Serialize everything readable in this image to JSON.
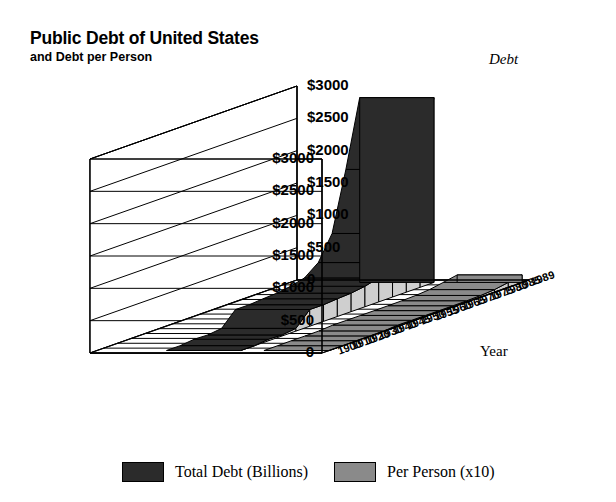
{
  "title": {
    "main": "Public Debt of United States",
    "sub": "and Debt per Person"
  },
  "axes": {
    "value_title": "Debt",
    "category_title": "Year",
    "value_ticks": [
      "$3000",
      "$2500",
      "$2000",
      "$1500",
      "$1000",
      "$500",
      "0"
    ]
  },
  "legend": {
    "items": [
      {
        "label": "Total Debt (Billions)",
        "color": "#2b2b2b"
      },
      {
        "label": "Per Person (x10)",
        "color": "#8a8a8a"
      }
    ]
  },
  "colors": {
    "series_total_top": "#2b2b2b",
    "series_total_side": "#cfcfcf",
    "series_person_top": "#8a8a8a",
    "series_person_side": "#c9c9c9",
    "frame_line": "#000000",
    "background": "#ffffff"
  },
  "chart_data": {
    "type": "area",
    "title": "Public Debt of United States and Debt per Person",
    "xlabel": "Year",
    "ylabel": "Debt",
    "ylim": [
      0,
      3000
    ],
    "yticks": [
      0,
      500,
      1000,
      1500,
      2000,
      2500,
      3000
    ],
    "grid": true,
    "legend_position": "bottom",
    "projection": "3d-ribbon",
    "categories": [
      "1900",
      "1910",
      "1920",
      "1930",
      "1940",
      "1945",
      "1950",
      "1955",
      "1960",
      "1965",
      "1970",
      "1975",
      "1980",
      "1985",
      "1989"
    ],
    "series": [
      {
        "name": "Total Debt (Billions)",
        "values": [
          1.3,
          1.1,
          24.3,
          16.2,
          43.0,
          258.7,
          257.4,
          274.4,
          286.3,
          317.3,
          370.9,
          533.2,
          907.7,
          1823.1,
          2857.4
        ]
      },
      {
        "name": "Per Person (x10)",
        "values": [
          0.2,
          0.1,
          2.3,
          1.3,
          3.3,
          18.5,
          17.0,
          16.6,
          15.9,
          16.3,
          18.1,
          24.7,
          39.9,
          76.0,
          115.7
        ]
      }
    ]
  }
}
